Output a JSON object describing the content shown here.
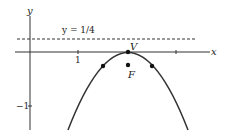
{
  "diagram": {
    "type": "parabola-focus-directrix",
    "axes": {
      "x_label": "x",
      "y_label": "y",
      "x_ticks": [
        {
          "value": 1,
          "label": "1"
        },
        {
          "value": 4,
          "label": ""
        }
      ],
      "y_ticks": [
        {
          "value": -1,
          "label": "−1"
        }
      ]
    },
    "directrix": {
      "label": "y = 1/4",
      "y": 0.25,
      "style": "dashed"
    },
    "vertex": {
      "label": "V",
      "x": 2,
      "y": 0
    },
    "focus": {
      "label": "F",
      "x": 2,
      "y": -0.25
    },
    "latus_rectum_points": [
      {
        "x": 1.5,
        "y": -0.25
      },
      {
        "x": 2.5,
        "y": -0.25
      }
    ],
    "curve": "y = -(x - 2)^2",
    "colors": {
      "curve": "#333333",
      "axes": "#333333",
      "points": "#111111"
    }
  }
}
